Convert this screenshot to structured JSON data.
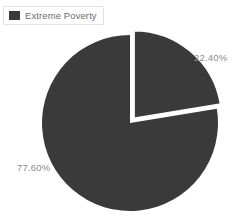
{
  "chart_data": {
    "type": "pie",
    "title": "",
    "categories": [
      "Extreme Poverty",
      "Remainder"
    ],
    "values": [
      22.4,
      77.6
    ],
    "labels": [
      "22.40%",
      "77.60%"
    ],
    "legend_entries": [
      "Extreme Poverty"
    ],
    "legend_position": "top-left",
    "colors": [
      "#3a3a3a",
      "#3a3a3a"
    ],
    "exploded_slice_index": 0,
    "explode_offset_px": 6,
    "start_angle_deg": 0,
    "direction": "clockwise",
    "grid": false,
    "background": "#ffffff"
  },
  "legend": {
    "items": [
      {
        "label": "Extreme Poverty",
        "swatch_color": "#3a3a3a"
      }
    ]
  },
  "pie": {
    "center_x": 130,
    "center_y": 123,
    "radius": 88,
    "slices": [
      {
        "name": "Extreme Poverty",
        "percent_label": "22.40%",
        "value": 22.4,
        "color": "#3a3a3a",
        "exploded": true
      },
      {
        "name": "Remainder",
        "percent_label": "77.60%",
        "value": 77.6,
        "color": "#3a3a3a",
        "exploded": false
      }
    ]
  },
  "labels": {
    "exploded": "22.40%",
    "main": "77.60%"
  },
  "colors": {
    "slice_fill": "#3a3a3a",
    "background": "#ffffff",
    "label_text": "#8a8a8a",
    "legend_text": "#6e6e6e",
    "legend_border": "#e2e2e2"
  }
}
